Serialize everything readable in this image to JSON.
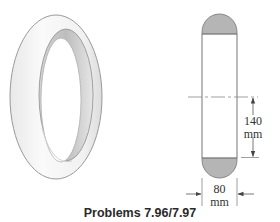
{
  "figure": {
    "caption": "Problems 7.96/7.97",
    "isometric_view": {
      "label": "ring",
      "fill_color": "#f2f2f2",
      "inner_shade_color": "#bdbdbd",
      "outline_color": "#9a9a9a"
    },
    "cross_section": {
      "cap_fill_color": "#b5b5b5",
      "line_color": "#555555",
      "centerline_style": "dashed",
      "dimensions": [
        {
          "name": "height",
          "value": "140",
          "unit": "mm"
        },
        {
          "name": "width",
          "value": "80",
          "unit": "mm"
        }
      ]
    }
  }
}
